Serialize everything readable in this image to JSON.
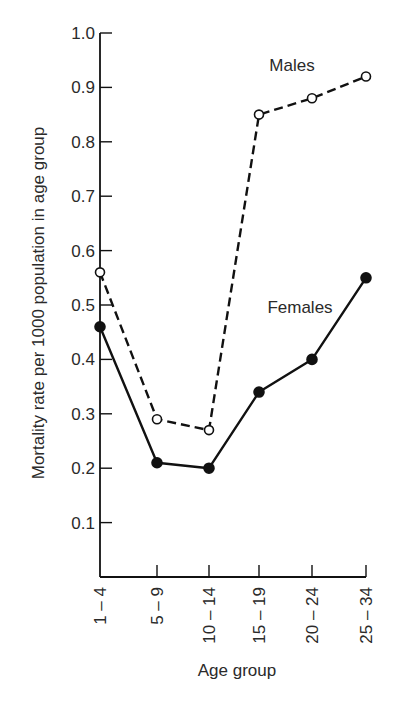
{
  "chart_data": {
    "type": "line",
    "title": "",
    "xlabel": "Age group",
    "ylabel": "Mortality rate per 1000 population in age group",
    "categories": [
      "1 – 4",
      "5 – 9",
      "10 – 14",
      "15 – 19",
      "20 – 24",
      "25 – 34"
    ],
    "ylim": [
      0,
      1.0
    ],
    "yticks": [
      "0.1",
      "0.2",
      "0.3",
      "0.4",
      "0.5",
      "0.6",
      "0.7",
      "0.8",
      "0.9",
      "1.0"
    ],
    "grid": false,
    "legend": "inline labels",
    "series": [
      {
        "name": "Males",
        "style": "dashed line, open circle markers",
        "values": [
          0.56,
          0.29,
          0.27,
          0.85,
          0.88,
          0.92
        ]
      },
      {
        "name": "Females",
        "style": "solid line, filled circle markers",
        "values": [
          0.46,
          0.21,
          0.2,
          0.34,
          0.4,
          0.55
        ]
      }
    ],
    "colors": {
      "line": "#111111",
      "text": "#2a2a2a",
      "background": "#ffffff"
    }
  }
}
